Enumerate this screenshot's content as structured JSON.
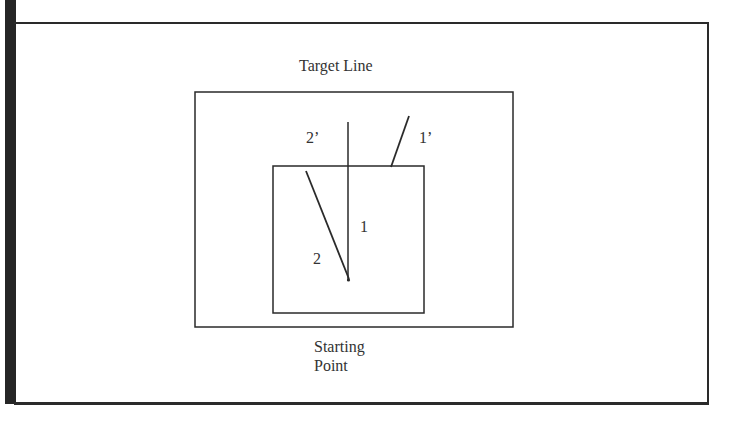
{
  "diagram": {
    "title_top": "Target Line",
    "title_bottom_line1": "Starting",
    "title_bottom_line2": "Point",
    "path_labels": {
      "path_1": "1",
      "path_2": "2",
      "path_1_prime": "1’",
      "path_2_prime": "2’"
    },
    "colors": {
      "stroke": "#2a2a2a",
      "background": "#ffffff",
      "frame_bar": "#262626"
    }
  }
}
